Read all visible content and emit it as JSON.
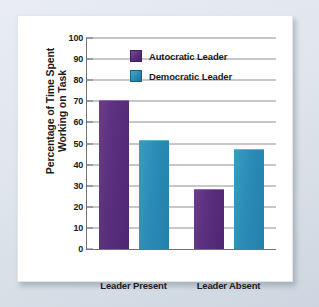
{
  "chart_data": {
    "type": "bar",
    "title": "",
    "xlabel": "",
    "ylabel": "Percentage of Time Spent Working on Task",
    "ylabel_line1": "Percentage of Time Spent",
    "ylabel_line2": "Working on Task",
    "categories": [
      "Leader Present",
      "Leader Absent"
    ],
    "series": [
      {
        "name": "Autocratic Leader",
        "values": [
          70,
          28
        ],
        "color": "#5B3080"
      },
      {
        "name": "Democratic Leader",
        "values": [
          51,
          47
        ],
        "color": "#2D8DB8"
      }
    ],
    "ylim": [
      0,
      100
    ],
    "ytick_step": 10,
    "ytick_labels": [
      "100",
      "90",
      "80",
      "70",
      "60",
      "50",
      "40",
      "30",
      "20",
      "10",
      "0"
    ],
    "grid": true,
    "legend_position": "top-center"
  },
  "legend": {
    "items": [
      {
        "label": "Autocratic Leader",
        "color": "#5B3080"
      },
      {
        "label": "Democratic Leader",
        "color": "#2D8DB8"
      }
    ]
  },
  "colors": {
    "autocratic": "#5B3080",
    "democratic": "#2D8DB8",
    "gridline": "#8B9096",
    "axis": "#6F7378",
    "panel_background": "#FFFFFF",
    "frame_background": "#DFE5EC",
    "text": "#1B1B1B"
  }
}
